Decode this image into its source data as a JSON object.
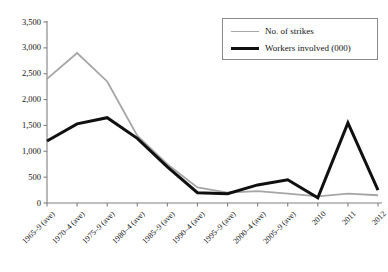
{
  "chart_data": {
    "type": "line",
    "title": "",
    "xlabel": "",
    "ylabel": "",
    "ylim": [
      0,
      3500
    ],
    "ytick_values": [
      0,
      500,
      1000,
      1500,
      2000,
      2500,
      3000,
      3500
    ],
    "ytick_labels": [
      "0",
      "500",
      "1,000",
      "1,500",
      "2,000",
      "2,500",
      "3,000",
      "3,500"
    ],
    "grid": false,
    "legend_position": "top-right",
    "categories": [
      "1965–9 (ave)",
      "1970–4 (ave)",
      "1975–9 (ave)",
      "1980–4 (ave)",
      "1985–9 (ave)",
      "1990–4 (ave)",
      "1995–9 (ave)",
      "2000–4 (ave)",
      "2005–9 (ave)",
      "2010",
      "2011",
      "2012"
    ],
    "series": [
      {
        "name": "No. of strikes",
        "color": "#a6a6a6",
        "width": 1.8,
        "values": [
          2400,
          2900,
          2350,
          1300,
          750,
          300,
          200,
          230,
          180,
          130,
          180,
          150
        ]
      },
      {
        "name": "Workers involved (000)",
        "color": "#101010",
        "width": 3.0,
        "values": [
          1200,
          1530,
          1650,
          1250,
          700,
          200,
          180,
          350,
          450,
          100,
          1550,
          250
        ]
      }
    ]
  },
  "legend": {
    "items": [
      {
        "label": "No. of strikes",
        "swatch": "gray"
      },
      {
        "label": "Workers involved (000)",
        "swatch": "black"
      }
    ]
  },
  "caption": {
    "text": ""
  },
  "axis": {
    "color": "#808080"
  }
}
